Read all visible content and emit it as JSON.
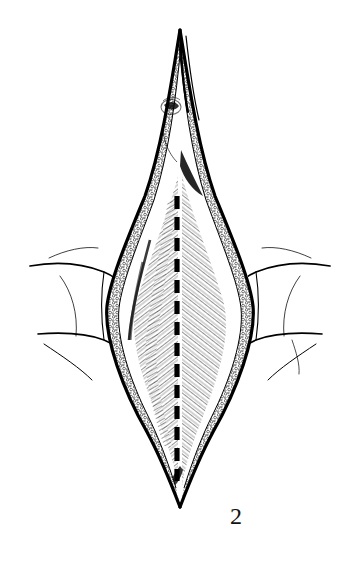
{
  "figure": {
    "caption": "2",
    "medium": "pen-and-ink line drawing",
    "background_color": "#ffffff",
    "ink_color": "#000000",
    "label_color": "#111111"
  },
  "illustration": {
    "type": "surgical-anatomy-line-drawing",
    "orientation": "vertical",
    "parts": [
      {
        "name": "skin-edge-left",
        "label": "Retracted skin edge, left",
        "description": "Bold outer contour curving from upper tip down to lower tip"
      },
      {
        "name": "skin-edge-right",
        "label": "Retracted skin edge, right",
        "description": "Bold outer contour mirroring the left edge"
      },
      {
        "name": "subcutaneous-fat-left",
        "label": "Subcutaneous fat, left",
        "description": "Stippled globular band inside the left skin edge"
      },
      {
        "name": "subcutaneous-fat-right",
        "label": "Subcutaneous fat, right",
        "description": "Stippled globular band inside the right skin edge"
      },
      {
        "name": "rectus-sheath-left",
        "label": "Anterior rectus sheath, left",
        "description": "Hatched fibres angled down and inward to the midline"
      },
      {
        "name": "rectus-sheath-right",
        "label": "Anterior rectus sheath, right",
        "description": "Hatched fibres angled down and inward to the midline"
      },
      {
        "name": "linea-alba-incision",
        "label": "Proposed midline incision",
        "description": "Heavy broken line running down the linea alba"
      },
      {
        "name": "umbilicus",
        "label": "Umbilicus",
        "description": "Small stippled depression left of the upper incision"
      },
      {
        "name": "abdominal-wall-left",
        "label": "Abdominal wall skin, left",
        "description": "Skin surface with contour folds lateral to the wound"
      },
      {
        "name": "abdominal-wall-right",
        "label": "Abdominal wall skin, right",
        "description": "Skin surface with contour folds lateral to the wound"
      }
    ],
    "geometry": {
      "wound_top_tip": [
        180,
        28
      ],
      "wound_bottom_tip": [
        180,
        508
      ],
      "wound_widest_y": 300,
      "wound_left_extent_x": 105,
      "wound_right_extent_x": 258,
      "incision_line_x": 177,
      "incision_line_top_y": 196,
      "incision_line_bottom_y": 481
    }
  }
}
